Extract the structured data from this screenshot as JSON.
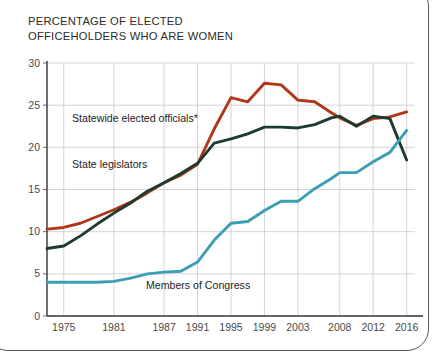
{
  "chart_data": {
    "type": "line",
    "title": "PERCENTAGE OF ELECTED\nOFFICEHOLDERS WHO ARE WOMEN",
    "title_line1": "PERCENTAGE OF ELECTED",
    "title_line2": "OFFICEHOLDERS WHO ARE WOMEN",
    "xlabel": "",
    "ylabel": "",
    "xlim": [
      1973,
      2017
    ],
    "ylim": [
      0,
      30
    ],
    "grid": true,
    "legend_position": "inline-annotations",
    "x_tick_labels": [
      "1975",
      "1981",
      "1987",
      "1991",
      "1995",
      "1999",
      "2003",
      "2008",
      "2012",
      "2016"
    ],
    "x_tick_values": [
      1975,
      1981,
      1987,
      1991,
      1995,
      1999,
      2003,
      2008,
      2012,
      2016
    ],
    "y_tick_labels": [
      "0",
      "5",
      "10",
      "15",
      "20",
      "25",
      "30"
    ],
    "y_tick_values": [
      0,
      5,
      10,
      15,
      20,
      25,
      30
    ],
    "series": [
      {
        "name": "Statewide elected officials*",
        "color": "#b0381a",
        "annotation": "Statewide elected officials*",
        "x": [
          1973,
          1975,
          1977,
          1979,
          1981,
          1983,
          1985,
          1987,
          1989,
          1991,
          1993,
          1995,
          1997,
          1999,
          2001,
          2003,
          2005,
          2007,
          2008,
          2010,
          2012,
          2014,
          2016
        ],
        "values": [
          10.3,
          10.5,
          11.0,
          11.8,
          12.6,
          13.5,
          14.6,
          15.8,
          16.7,
          18.0,
          22.2,
          25.9,
          25.4,
          27.6,
          27.4,
          25.6,
          25.4,
          24.1,
          23.5,
          22.6,
          23.4,
          23.6,
          24.2
        ]
      },
      {
        "name": "State legislators",
        "color": "#1d3b2e",
        "annotation": "State legislators",
        "x": [
          1973,
          1975,
          1977,
          1979,
          1981,
          1983,
          1985,
          1987,
          1989,
          1991,
          1993,
          1995,
          1997,
          1999,
          2001,
          2003,
          2005,
          2007,
          2008,
          2010,
          2012,
          2014,
          2016
        ],
        "values": [
          8.0,
          8.3,
          9.5,
          10.9,
          12.2,
          13.4,
          14.8,
          15.8,
          16.9,
          18.1,
          20.5,
          21.0,
          21.6,
          22.4,
          22.4,
          22.3,
          22.7,
          23.5,
          23.7,
          22.5,
          23.7,
          23.4,
          18.5
        ]
      },
      {
        "name": "Members of Congress",
        "color": "#3d9db5",
        "annotation": "Members of Congress",
        "x": [
          1973,
          1975,
          1977,
          1979,
          1981,
          1983,
          1985,
          1987,
          1989,
          1991,
          1993,
          1995,
          1997,
          1999,
          2001,
          2003,
          2005,
          2007,
          2008,
          2010,
          2012,
          2014,
          2016
        ],
        "values": [
          4.0,
          4.0,
          4.0,
          4.0,
          4.1,
          4.5,
          5.0,
          5.2,
          5.3,
          6.4,
          9.0,
          11.0,
          11.2,
          12.5,
          13.6,
          13.6,
          15.1,
          16.3,
          17.0,
          17.0,
          18.3,
          19.4,
          22.0
        ]
      }
    ]
  }
}
